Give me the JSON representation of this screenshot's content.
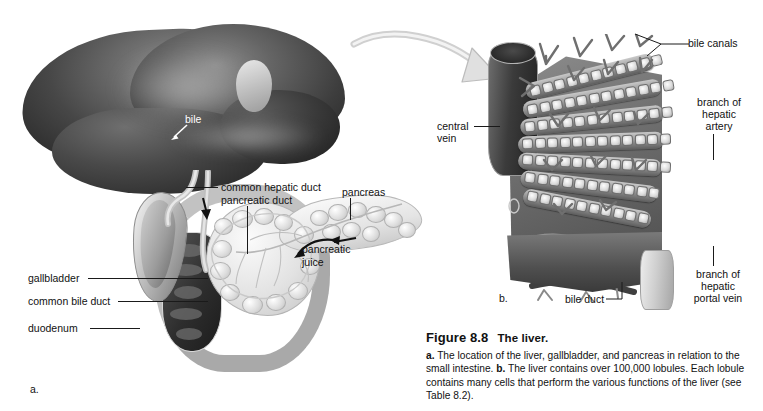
{
  "figure": {
    "number": "Figure 8.8",
    "title": "The liver.",
    "caption_a_prefix": "a.",
    "caption_a": " The location of the liver, gallbladder, and pancreas in relation to the small intestine. ",
    "caption_b_prefix": "b.",
    "caption_b": " The liver contains over 100,000 lobules. Each lobule contains many cells that perform the various functions of the liver (see Table 8.2)."
  },
  "panel_a": {
    "marker": "a.",
    "labels": {
      "bile": "bile",
      "common_hepatic_duct": "common hepatic duct",
      "pancreatic_duct": "pancreatic duct",
      "pancreas": "pancreas",
      "pancreatic_juice_line1": "pancreatic",
      "pancreatic_juice_line2": "juice",
      "gallbladder": "gallbladder",
      "common_bile_duct": "common bile duct",
      "duodenum": "duodenum"
    }
  },
  "panel_b": {
    "marker": "b.",
    "labels": {
      "bile_canals": "bile canals",
      "branch_hepatic_artery_line1": "branch of",
      "branch_hepatic_artery_line2": "hepatic",
      "branch_hepatic_artery_line3": "artery",
      "branch_portal_vein_line1": "branch of",
      "branch_portal_vein_line2": "hepatic",
      "branch_portal_vein_line3": "portal vein",
      "central_vein_line1": "central",
      "central_vein_line2": "vein",
      "bile_duct": "bile duct"
    }
  },
  "colors": {
    "background": "#ffffff",
    "text": "#111111",
    "leader": "#1a1a1a",
    "liver_dark": "#3d3d3d",
    "pancreas_light": "#e2e2e2",
    "arrow_gray": "#d9d9d9"
  }
}
